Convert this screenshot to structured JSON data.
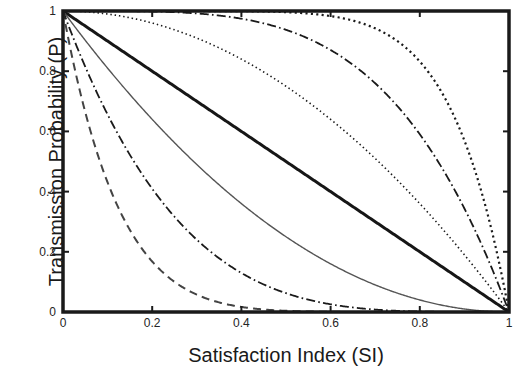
{
  "chart_data": {
    "type": "line",
    "title": "",
    "xlabel": "Satisfaction Index (SI)",
    "ylabel": "Transmission Probability (P)",
    "xlim": [
      0,
      1
    ],
    "ylim": [
      0,
      1
    ],
    "xticks": [
      "0",
      "0.2",
      "0.4",
      "0.6",
      "0.8",
      "1"
    ],
    "xtick_values": [
      0,
      0.2,
      0.4,
      0.6,
      0.8,
      1
    ],
    "yticks": [
      "0",
      "0.2",
      "0.4",
      "0.6",
      "0.8",
      "1"
    ],
    "ytick_values": [
      0,
      0.2,
      0.4,
      0.6,
      0.8,
      1
    ],
    "grid": false,
    "legend": "none",
    "x": [
      0,
      0.05,
      0.1,
      0.15,
      0.2,
      0.25,
      0.3,
      0.35,
      0.4,
      0.45,
      0.5,
      0.55,
      0.6,
      0.65,
      0.7,
      0.75,
      0.8,
      0.85,
      0.9,
      0.95,
      1
    ],
    "series": [
      {
        "name": "P = 1 - SI^8",
        "exponent": 8,
        "shape": "convex",
        "style": "dotted",
        "color": "#1a1a1a",
        "width": 2.2,
        "values": [
          1,
          1,
          1,
          1,
          0.99997,
          0.99985,
          0.99934,
          0.99747,
          0.99346,
          0.98321,
          0.99609,
          0.98335,
          0.98321,
          0.96972,
          0.94235,
          0.89989,
          0.83222,
          0.72752,
          0.56953,
          0.33648,
          0
        ]
      },
      {
        "name": "P = 1 - SI^4",
        "exponent": 4,
        "shape": "convex",
        "style": "dashdot",
        "color": "#1a1a1a",
        "width": 1.8,
        "values": [
          1,
          0.99999,
          0.9999,
          0.99949,
          0.9984,
          0.99609,
          0.9919,
          0.98499,
          0.9744,
          0.95899,
          0.9375,
          0.9085,
          0.8704,
          0.8215,
          0.7599,
          0.68359,
          0.5904,
          0.478,
          0.3439,
          0.1855,
          0
        ]
      },
      {
        "name": "P = 1 - SI^2",
        "exponent": 2,
        "shape": "convex",
        "style": "dotted-fine",
        "color": "#1a1a1a",
        "width": 1.6,
        "values": [
          1,
          0.9975,
          0.99,
          0.9775,
          0.96,
          0.9375,
          0.91,
          0.8775,
          0.84,
          0.7975,
          0.75,
          0.6975,
          0.64,
          0.5775,
          0.51,
          0.4375,
          0.36,
          0.2775,
          0.19,
          0.0975,
          0
        ]
      },
      {
        "name": "P = 1 - SI",
        "exponent": 1,
        "shape": "linear",
        "style": "solid",
        "color": "#161616",
        "width": 3.0,
        "values": [
          1,
          0.95,
          0.9,
          0.85,
          0.8,
          0.75,
          0.7,
          0.65,
          0.6,
          0.55,
          0.5,
          0.45,
          0.4,
          0.35,
          0.3,
          0.25,
          0.2,
          0.15,
          0.1,
          0.05,
          0
        ]
      },
      {
        "name": "P = (1 - SI)^2",
        "exponent": 0.5,
        "shape": "concave",
        "style": "solid-thin",
        "color": "#555555",
        "width": 1.4,
        "values": [
          1,
          0.9025,
          0.81,
          0.7225,
          0.64,
          0.5625,
          0.49,
          0.4225,
          0.36,
          0.3025,
          0.25,
          0.2025,
          0.16,
          0.1225,
          0.09,
          0.0625,
          0.04,
          0.0225,
          0.01,
          0.0025,
          0
        ]
      },
      {
        "name": "P = (1 - SI)^4",
        "exponent": 0.25,
        "shape": "concave",
        "style": "dashdot",
        "color": "#1a1a1a",
        "width": 1.8,
        "values": [
          1,
          0.81451,
          0.6561,
          0.52201,
          0.4096,
          0.31641,
          0.2401,
          0.17851,
          0.1296,
          0.09151,
          0.0625,
          0.04101,
          0.0256,
          0.01501,
          0.0081,
          0.00391,
          0.0016,
          0.00051,
          0.0001,
          1e-05,
          0
        ]
      },
      {
        "name": "P = (1 - SI)^8",
        "exponent": 0.125,
        "shape": "concave",
        "style": "dashed",
        "color": "#444444",
        "width": 2.0,
        "values": [
          1,
          0.66342,
          0.43047,
          0.27249,
          0.16777,
          0.10011,
          0.05765,
          0.03186,
          0.0168,
          0.00838,
          0.00391,
          0.00168,
          0.00066,
          0.00023,
          7e-05,
          2e-05,
          3e-06,
          0,
          0,
          0,
          0
        ]
      }
    ]
  },
  "axes": {
    "frame_color": "#1a1a1a",
    "background": "#ffffff"
  }
}
